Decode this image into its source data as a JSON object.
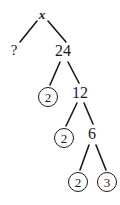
{
  "diagram": {
    "type": "factor-tree",
    "nodes": [
      {
        "id": "root",
        "label": "x",
        "style": "bold-italic",
        "circled": false,
        "x": 42,
        "y": 14
      },
      {
        "id": "n-unknown",
        "label": "?",
        "style": "plain",
        "circled": false,
        "x": 14,
        "y": 50
      },
      {
        "id": "n-24",
        "label": "24",
        "style": "plain",
        "circled": false,
        "x": 63,
        "y": 51
      },
      {
        "id": "n-2a",
        "label": "2",
        "style": "plain",
        "circled": true,
        "x": 48,
        "y": 97
      },
      {
        "id": "n-12",
        "label": "12",
        "style": "plain",
        "circled": false,
        "x": 80,
        "y": 93
      },
      {
        "id": "n-2b",
        "label": "2",
        "style": "plain",
        "circled": true,
        "x": 64,
        "y": 138
      },
      {
        "id": "n-6",
        "label": "6",
        "style": "plain",
        "circled": false,
        "x": 92,
        "y": 134
      },
      {
        "id": "n-2c",
        "label": "2",
        "style": "plain",
        "circled": true,
        "x": 78,
        "y": 182
      },
      {
        "id": "n-3",
        "label": "3",
        "style": "plain",
        "circled": true,
        "x": 107,
        "y": 182
      }
    ],
    "edges": [
      {
        "from": "root",
        "to": "n-unknown",
        "x1": 37,
        "y1": 21,
        "x2": 20,
        "y2": 42
      },
      {
        "from": "root",
        "to": "n-24",
        "x1": 48,
        "y1": 21,
        "x2": 66,
        "y2": 42
      },
      {
        "from": "n-24",
        "to": "n-2a",
        "x1": 60,
        "y1": 62,
        "x2": 50,
        "y2": 85
      },
      {
        "from": "n-24",
        "to": "n-12",
        "x1": 68,
        "y1": 62,
        "x2": 79,
        "y2": 83
      },
      {
        "from": "n-12",
        "to": "n-2b",
        "x1": 77,
        "y1": 103,
        "x2": 66,
        "y2": 126
      },
      {
        "from": "n-12",
        "to": "n-6",
        "x1": 84,
        "y1": 103,
        "x2": 93,
        "y2": 124
      },
      {
        "from": "n-6",
        "to": "n-2c",
        "x1": 89,
        "y1": 145,
        "x2": 80,
        "y2": 170
      },
      {
        "from": "n-6",
        "to": "n-3",
        "x1": 96,
        "y1": 145,
        "x2": 106,
        "y2": 170
      }
    ],
    "colors": {
      "ink": "#1a1a1a",
      "background": "#ffffff"
    }
  }
}
